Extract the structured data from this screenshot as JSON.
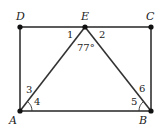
{
  "diagram": {
    "points": {
      "D": {
        "label": "D",
        "x": 20,
        "y": 27
      },
      "E": {
        "label": "E",
        "x": 85,
        "y": 27
      },
      "C": {
        "label": "C",
        "x": 151,
        "y": 27
      },
      "A": {
        "label": "A",
        "x": 20,
        "y": 111
      },
      "B": {
        "label": "B",
        "x": 151,
        "y": 111
      }
    },
    "angle_labels": {
      "a1": "1",
      "a2": "2",
      "a3": "3",
      "a4": "4",
      "a5": "5",
      "a6": "6",
      "apex": "77°"
    },
    "colors": {
      "line": "#333333",
      "point": "#111111"
    }
  }
}
